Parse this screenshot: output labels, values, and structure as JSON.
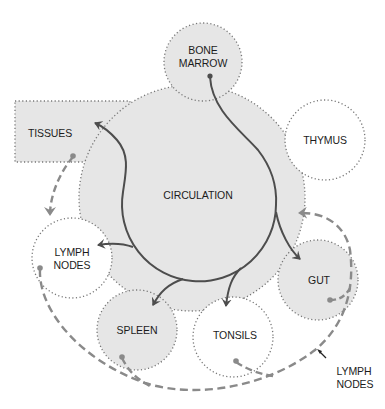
{
  "diagram": {
    "type": "lymphocyte-circulation",
    "colors": {
      "organ_fill_gray": "#e6e6e6",
      "organ_fill_white": "#ffffff",
      "dotted_outline": "#777777",
      "blood_flow_arrow": "#4d4d4d",
      "lymph_flow_dashed": "#8a8a8a",
      "text": "#1c1c1c"
    },
    "nodes": {
      "bone_marrow": {
        "line1": "BONE",
        "line2": "MARROW",
        "fill": "gray"
      },
      "thymus": {
        "label": "THYMUS",
        "fill": "white"
      },
      "tissues": {
        "label": "TISSUES",
        "fill": "gray"
      },
      "circulation": {
        "label": "CIRCULATION",
        "fill": "gray"
      },
      "lymph_nodes": {
        "line1": "LYMPH",
        "line2": "NODES",
        "fill": "white"
      },
      "gut": {
        "label": "GUT",
        "fill": "gray"
      },
      "spleen": {
        "label": "SPLEEN",
        "fill": "gray"
      },
      "tonsils": {
        "label": "TONSILS",
        "fill": "white"
      }
    },
    "annotations": {
      "lymph_vessel_label": {
        "line1": "LYMPH",
        "line2": "NODES"
      }
    },
    "edges": [
      {
        "from": "bone_marrow",
        "to": "circulation",
        "style": "solid"
      },
      {
        "from": "circulation",
        "to": "tissues",
        "style": "solid"
      },
      {
        "from": "circulation",
        "to": "lymph_nodes",
        "style": "solid"
      },
      {
        "from": "circulation",
        "to": "spleen",
        "style": "solid"
      },
      {
        "from": "circulation",
        "to": "tonsils",
        "style": "solid"
      },
      {
        "from": "circulation",
        "to": "gut",
        "style": "solid"
      },
      {
        "from": "tissues",
        "to": "lymph_nodes",
        "style": "dashed"
      },
      {
        "from": "lymph_nodes",
        "to": "circulation",
        "style": "dashed"
      },
      {
        "from": "spleen",
        "to": "circulation",
        "style": "dashed"
      },
      {
        "from": "tonsils",
        "to": "circulation",
        "style": "dashed"
      },
      {
        "from": "gut",
        "to": "circulation",
        "style": "dashed"
      }
    ]
  }
}
